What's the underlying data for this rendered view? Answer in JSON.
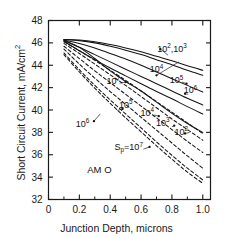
{
  "chart_data": {
    "type": "line",
    "title": "",
    "xlabel": "Junction Depth, microns",
    "ylabel": "Short Circuit Current, mA/cm2",
    "ylabel_main": "Short Circuit Current, mA/cm",
    "ylabel_exp": "2",
    "xlim": [
      0,
      1.05
    ],
    "ylim": [
      32,
      48
    ],
    "xticks": [
      0,
      0.2,
      0.4,
      0.6,
      0.8,
      1.0
    ],
    "xticklabels": [
      "0",
      "0.2",
      "0.4",
      "0.6",
      "0.8",
      "1.0"
    ],
    "xminor_step": 0.1,
    "yticks": [
      32,
      34,
      36,
      38,
      40,
      42,
      44,
      46,
      48
    ],
    "yticklabels": [
      "32",
      "34",
      "36",
      "38",
      "40",
      "42",
      "44",
      "46",
      "48"
    ],
    "grid": false,
    "legend": "none (inline curve annotations)",
    "annotations": [
      {
        "id": "am0",
        "text": "AM O",
        "x": 0.33,
        "y": 34.4
      },
      {
        "id": "sp-label",
        "text_main": "S",
        "text_sub": "p",
        "text_eq": "=10",
        "text_exp": "7",
        "x": 0.52,
        "y": 36.4
      },
      {
        "id": "solid-102-103",
        "text_main": "10",
        "text_exp": "2",
        "text_tail": ",10",
        "text_exp2": "3",
        "x": 0.8,
        "y": 45.2
      },
      {
        "id": "solid-104",
        "text_main": "10",
        "text_exp": "4",
        "x": 0.7,
        "y": 43.4
      },
      {
        "id": "solid-105",
        "text_main": "10",
        "text_exp": "5",
        "x": 0.83,
        "y": 42.4
      },
      {
        "id": "solid-106",
        "text_main": "10",
        "text_exp": "6",
        "x": 0.92,
        "y": 41.5
      },
      {
        "id": "solid-107",
        "text_main": "10",
        "text_exp": "7",
        "x": 0.42,
        "y": 42.3
      },
      {
        "id": "dashed-105",
        "text_main": "10",
        "text_exp": "5",
        "x": 0.5,
        "y": 40.2
      },
      {
        "id": "dashed-106",
        "text_main": "10",
        "text_exp": "6",
        "x": 0.22,
        "y": 38.5
      },
      {
        "id": "dashed-104",
        "text_main": "10",
        "text_exp": "4",
        "x": 0.64,
        "y": 39.5
      },
      {
        "id": "dashed-103",
        "text_main": "10",
        "text_exp": "3",
        "x": 0.74,
        "y": 38.6
      },
      {
        "id": "dashed-102",
        "text_main": "10",
        "text_exp": "2",
        "x": 0.86,
        "y": 37.8
      }
    ],
    "series": [
      {
        "name": "Sp=10^2 (solid)",
        "style": "solid",
        "group": "upper",
        "x": [
          0.1,
          0.2,
          0.3,
          0.4,
          0.5,
          0.6,
          0.7,
          0.8,
          0.9,
          1.0
        ],
        "y": [
          46.3,
          46.25,
          46.1,
          45.85,
          45.55,
          45.2,
          44.8,
          44.4,
          43.95,
          43.55
        ]
      },
      {
        "name": "Sp=10^3 (solid)",
        "style": "solid",
        "group": "upper",
        "x": [
          0.1,
          0.2,
          0.3,
          0.4,
          0.5,
          0.6,
          0.7,
          0.8,
          0.9,
          1.0
        ],
        "y": [
          46.3,
          46.2,
          46.0,
          45.7,
          45.35,
          44.95,
          44.5,
          44.05,
          43.55,
          43.1
        ]
      },
      {
        "name": "Sp=10^4 (solid)",
        "style": "solid",
        "group": "upper",
        "x": [
          0.1,
          0.2,
          0.3,
          0.4,
          0.5,
          0.6,
          0.7,
          0.8,
          0.9,
          1.0
        ],
        "y": [
          46.25,
          45.95,
          45.55,
          45.05,
          44.55,
          44.0,
          43.4,
          42.8,
          42.2,
          41.6
        ]
      },
      {
        "name": "Sp=10^5 (solid)",
        "style": "solid",
        "group": "upper",
        "x": [
          0.1,
          0.2,
          0.3,
          0.4,
          0.5,
          0.6,
          0.7,
          0.8,
          0.9,
          1.0
        ],
        "y": [
          46.2,
          45.6,
          44.95,
          44.3,
          43.65,
          43.0,
          42.35,
          41.7,
          41.05,
          40.45
        ]
      },
      {
        "name": "Sp=10^6 (solid)",
        "style": "solid",
        "group": "upper",
        "x": [
          0.1,
          0.2,
          0.3,
          0.4,
          0.5,
          0.6,
          0.7,
          0.8,
          0.9,
          1.0
        ],
        "y": [
          46.15,
          45.3,
          44.5,
          43.75,
          43.05,
          42.35,
          41.65,
          41.0,
          40.3,
          39.65
        ]
      },
      {
        "name": "Sp=10^7 (solid)",
        "style": "solid",
        "group": "upper",
        "x": [
          0.1,
          0.2,
          0.3,
          0.4,
          0.5,
          0.6,
          0.7,
          0.8,
          0.9,
          1.0
        ],
        "y": [
          46.25,
          45.6,
          44.6,
          43.5,
          42.55,
          41.7,
          40.7,
          39.7,
          38.8,
          38.0
        ]
      },
      {
        "name": "Sp=10^2 (dashed)",
        "style": "dashed",
        "group": "lower",
        "x": [
          0.1,
          0.2,
          0.3,
          0.4,
          0.5,
          0.6,
          0.7,
          0.8,
          0.9,
          1.0
        ],
        "y": [
          46.1,
          45.3,
          44.45,
          43.55,
          42.65,
          41.7,
          40.75,
          39.8,
          38.85,
          37.9
        ]
      },
      {
        "name": "Sp=10^3 (dashed)",
        "style": "dashed",
        "group": "lower",
        "x": [
          0.1,
          0.2,
          0.3,
          0.4,
          0.5,
          0.6,
          0.7,
          0.8,
          0.9,
          1.0
        ],
        "y": [
          45.95,
          45.05,
          44.1,
          43.15,
          42.2,
          41.2,
          40.2,
          39.2,
          38.25,
          37.3
        ]
      },
      {
        "name": "Sp=10^4 (dashed)",
        "style": "dashed",
        "group": "lower",
        "x": [
          0.1,
          0.2,
          0.3,
          0.4,
          0.5,
          0.6,
          0.7,
          0.8,
          0.9,
          1.0
        ],
        "y": [
          45.7,
          44.6,
          43.5,
          42.45,
          41.4,
          40.35,
          39.3,
          38.25,
          37.2,
          36.2
        ]
      },
      {
        "name": "Sp=10^5 (dashed)",
        "style": "dashed",
        "group": "lower",
        "x": [
          0.1,
          0.2,
          0.3,
          0.4,
          0.5,
          0.6,
          0.7,
          0.8,
          0.9,
          1.0
        ],
        "y": [
          45.45,
          44.1,
          42.85,
          41.65,
          40.5,
          39.35,
          38.2,
          37.05,
          35.9,
          34.8
        ]
      },
      {
        "name": "Sp=10^6 (dashed)",
        "style": "dashed",
        "group": "lower",
        "x": [
          0.1,
          0.2,
          0.3,
          0.4,
          0.5,
          0.6,
          0.7,
          0.8,
          0.9,
          1.0
        ],
        "y": [
          45.1,
          43.6,
          42.2,
          40.9,
          39.65,
          38.4,
          37.15,
          35.95,
          34.8,
          33.75
        ]
      },
      {
        "name": "Sp=10^7 (dashed)",
        "style": "dashed",
        "group": "lower",
        "x": [
          0.1,
          0.2,
          0.3,
          0.4,
          0.5,
          0.6,
          0.7,
          0.8,
          0.9,
          1.0
        ],
        "y": [
          44.95,
          43.4,
          41.95,
          40.6,
          39.3,
          38.05,
          36.8,
          35.6,
          34.45,
          33.45
        ]
      }
    ],
    "leader_lines": [
      {
        "from_x": 0.775,
        "from_y": 44.9,
        "to_x": 0.725,
        "to_y": 45.45
      },
      {
        "from_x": 0.845,
        "from_y": 44.3,
        "to_x": 0.7,
        "to_y": 43.1
      },
      {
        "from_x": 0.865,
        "from_y": 42.5,
        "to_x": 0.895,
        "to_y": 42.35
      },
      {
        "from_x": 0.905,
        "from_y": 41.4,
        "to_x": 0.885,
        "to_y": 41.45
      },
      {
        "from_x": 0.46,
        "from_y": 42.4,
        "to_x": 0.5,
        "to_y": 42.5
      },
      {
        "from_x": 0.445,
        "from_y": 39.95,
        "to_x": 0.48,
        "to_y": 40.1
      },
      {
        "from_x": 0.335,
        "from_y": 39.65,
        "to_x": 0.295,
        "to_y": 39.0
      },
      {
        "from_x": 0.685,
        "from_y": 39.55,
        "to_x": 0.715,
        "to_y": 39.45
      },
      {
        "from_x": 0.8,
        "from_y": 38.5,
        "to_x": 0.815,
        "to_y": 38.6
      },
      {
        "from_x": 0.915,
        "from_y": 38.0,
        "to_x": 0.885,
        "to_y": 37.9
      },
      {
        "from_x": 0.615,
        "from_y": 36.5,
        "to_x": 0.655,
        "to_y": 36.7
      }
    ]
  }
}
